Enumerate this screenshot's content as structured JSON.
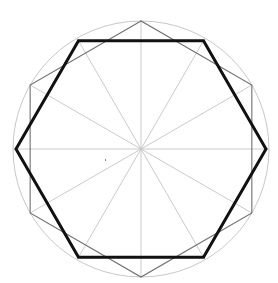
{
  "diagram": {
    "width": 278,
    "height": 283,
    "center": [
      141,
      149
    ],
    "circle": {
      "radius": 128,
      "stroke": "#c8c8c8",
      "stroke_width": 1
    },
    "spokes": {
      "count": 12,
      "length": 128,
      "stroke": "#c4c4c4",
      "stroke_width": 0.9,
      "start_angle_deg": 0
    },
    "thin_hexagon": {
      "radius": 128,
      "rotation_deg": 90,
      "stroke": "#707070",
      "stroke_width": 1.1
    },
    "bold_hexagon": {
      "radius": 125,
      "rotation_deg": 0,
      "stroke": "#111111",
      "stroke_width": 3
    },
    "stray_dot": {
      "position": [
        105,
        159
      ],
      "color": "#888888"
    }
  }
}
